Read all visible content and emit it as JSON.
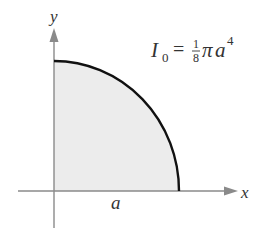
{
  "diagram": {
    "type": "quarter-circle region",
    "axes": {
      "x_label": "x",
      "y_label": "y"
    },
    "dimension_label": "a",
    "formula": {
      "lhs": "I",
      "lhs_subscript": "0",
      "equals": "=",
      "fraction_numerator": "1",
      "fraction_denominator": "8",
      "pi": "π",
      "var": "a",
      "exponent": "4"
    },
    "colors": {
      "axis": "#8a8a8a",
      "curve": "#111111",
      "fill": "#ececec",
      "text": "#333333"
    }
  }
}
